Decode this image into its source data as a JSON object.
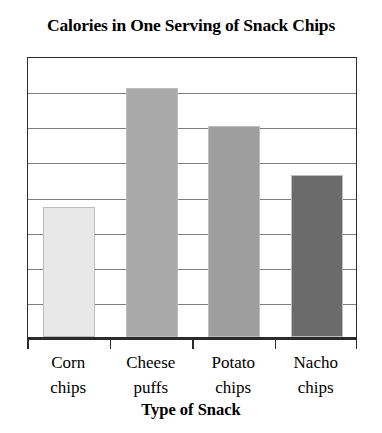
{
  "chart_data": {
    "type": "bar",
    "title": "Calories in One Serving of Snack Chips",
    "xlabel": "Type of Snack",
    "ylabel": "",
    "categories": [
      "Corn chips",
      "Cheese puffs",
      "Potato chips",
      "Nacho chips"
    ],
    "category_lines": [
      [
        "Corn",
        "chips"
      ],
      [
        "Cheese",
        "puffs"
      ],
      [
        "Potato",
        "chips"
      ],
      [
        "Nacho",
        "chips"
      ]
    ],
    "values": [
      3.7,
      7.1,
      6.0,
      4.6
    ],
    "ylim": [
      0,
      8
    ],
    "ytick_values": [
      0,
      1,
      2,
      3,
      4,
      5,
      6,
      7,
      8
    ],
    "ytick_labels": [],
    "grid": true,
    "grid_axis": "y",
    "legend": false,
    "legend_position": "none",
    "bar_colors": [
      "#e8e8e8",
      "#a9a9a9",
      "#9e9e9e",
      "#6b6b6b"
    ],
    "bar_border_color": "#bdbdbd",
    "axis_color": "#2b2b2b",
    "gridline_color": "#7d7d7d",
    "background": "#ffffff"
  }
}
